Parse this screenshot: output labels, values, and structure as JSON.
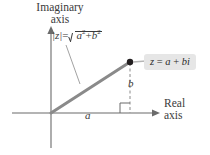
{
  "figure": {
    "background": "#ffffff"
  },
  "axes": {
    "imaginary": {
      "line1": "Imaginary",
      "line2": "axis"
    },
    "real": {
      "line1": "Real",
      "line2": "axis"
    }
  },
  "labels": {
    "real_part": "a",
    "imaginary_part": "b"
  },
  "formula": {
    "modulus_lhs": "|z|",
    "equals": "=",
    "radicand_a": "a",
    "radicand_a_exp": "2",
    "plus": "+",
    "radicand_b": "b",
    "radicand_b_exp": "2"
  },
  "callout": {
    "point_label_z": "z",
    "point_label_eq": " = ",
    "point_label_a": "a",
    "point_label_plus": " + ",
    "point_label_bi": "bi",
    "background_color": "#e6e6e6"
  },
  "colors": {
    "axis": "#6b6b6b",
    "vector": "#8a8a8a",
    "dashed": "#8a8a8a",
    "point": "#231f20",
    "text": "#3a3a3a"
  },
  "geometry": {
    "origin_x": 51,
    "origin_y": 113,
    "point_x": 130,
    "point_y": 62
  }
}
